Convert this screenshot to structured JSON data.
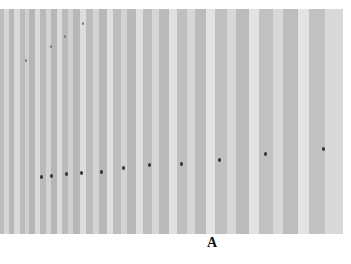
{
  "figure": {
    "panel_label": "A",
    "background_gray": "#c4c4c4",
    "stripes": [
      {
        "x": 0,
        "w": 4,
        "c": "#bdbdbd"
      },
      {
        "x": 4,
        "w": 5,
        "c": "#d6d6d6"
      },
      {
        "x": 9,
        "w": 5,
        "c": "#b8b8b8"
      },
      {
        "x": 14,
        "w": 6,
        "c": "#d9d9d9"
      },
      {
        "x": 20,
        "w": 5,
        "c": "#bcbcbc"
      },
      {
        "x": 25,
        "w": 4,
        "c": "#cfcfcf"
      },
      {
        "x": 29,
        "w": 6,
        "c": "#b5b5b5"
      },
      {
        "x": 35,
        "w": 5,
        "c": "#dadada"
      },
      {
        "x": 40,
        "w": 6,
        "c": "#bababa"
      },
      {
        "x": 46,
        "w": 5,
        "c": "#d3d3d3"
      },
      {
        "x": 51,
        "w": 6,
        "c": "#b6b6b6"
      },
      {
        "x": 57,
        "w": 5,
        "c": "#dcdcdc"
      },
      {
        "x": 62,
        "w": 6,
        "c": "#bbbbbb"
      },
      {
        "x": 68,
        "w": 5,
        "c": "#d0d0d0"
      },
      {
        "x": 73,
        "w": 7,
        "c": "#b7b7b7"
      },
      {
        "x": 80,
        "w": 6,
        "c": "#dddddd"
      },
      {
        "x": 86,
        "w": 7,
        "c": "#bcbcbc"
      },
      {
        "x": 93,
        "w": 6,
        "c": "#d4d4d4"
      },
      {
        "x": 99,
        "w": 8,
        "c": "#b8b8b8"
      },
      {
        "x": 107,
        "w": 6,
        "c": "#dedede"
      },
      {
        "x": 113,
        "w": 8,
        "c": "#bdbdbd"
      },
      {
        "x": 121,
        "w": 6,
        "c": "#d2d2d2"
      },
      {
        "x": 127,
        "w": 9,
        "c": "#b9b9b9"
      },
      {
        "x": 136,
        "w": 7,
        "c": "#dfdfdf"
      },
      {
        "x": 143,
        "w": 9,
        "c": "#bebebe"
      },
      {
        "x": 152,
        "w": 7,
        "c": "#d5d5d5"
      },
      {
        "x": 159,
        "w": 10,
        "c": "#bababa"
      },
      {
        "x": 169,
        "w": 8,
        "c": "#e0e0e0"
      },
      {
        "x": 177,
        "w": 10,
        "c": "#bfbfbf"
      },
      {
        "x": 187,
        "w": 8,
        "c": "#d6d6d6"
      },
      {
        "x": 195,
        "w": 11,
        "c": "#bbbbbb"
      },
      {
        "x": 206,
        "w": 9,
        "c": "#e1e1e1"
      },
      {
        "x": 215,
        "w": 12,
        "c": "#c0c0c0"
      },
      {
        "x": 227,
        "w": 9,
        "c": "#d7d7d7"
      },
      {
        "x": 236,
        "w": 13,
        "c": "#bcbcbc"
      },
      {
        "x": 249,
        "w": 10,
        "c": "#e2e2e2"
      },
      {
        "x": 259,
        "w": 14,
        "c": "#c1c1c1"
      },
      {
        "x": 273,
        "w": 10,
        "c": "#d8d8d8"
      },
      {
        "x": 283,
        "w": 15,
        "c": "#bdbdbd"
      },
      {
        "x": 298,
        "w": 11,
        "c": "#e3e3e3"
      },
      {
        "x": 309,
        "w": 16,
        "c": "#c2c2c2"
      },
      {
        "x": 325,
        "w": 18,
        "c": "#d9d9d9"
      }
    ],
    "spots": [
      {
        "x": 40,
        "y": 166
      },
      {
        "x": 50,
        "y": 165
      },
      {
        "x": 65,
        "y": 163
      },
      {
        "x": 80,
        "y": 162
      },
      {
        "x": 100,
        "y": 161
      },
      {
        "x": 122,
        "y": 157
      },
      {
        "x": 148,
        "y": 154
      },
      {
        "x": 180,
        "y": 153
      },
      {
        "x": 218,
        "y": 149
      },
      {
        "x": 264,
        "y": 143
      },
      {
        "x": 322,
        "y": 138
      }
    ],
    "faint_spots": [
      {
        "x": 82,
        "y": 13
      },
      {
        "x": 64,
        "y": 26
      },
      {
        "x": 50,
        "y": 36
      },
      {
        "x": 25,
        "y": 50
      }
    ]
  }
}
